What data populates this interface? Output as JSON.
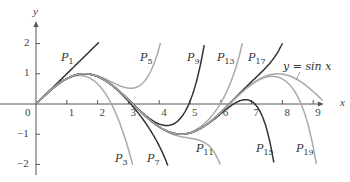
{
  "chart_data": {
    "type": "line",
    "title": "",
    "xlabel": "x",
    "ylabel": "y",
    "xlim": [
      0,
      9.3
    ],
    "ylim": [
      -2.2,
      2.5
    ],
    "x_ticks": [
      "0",
      "1",
      "2",
      "3",
      "4",
      "5",
      "6",
      "7",
      "8",
      "9"
    ],
    "y_ticks": [
      "2",
      "1",
      "-1",
      "-2"
    ],
    "grid": false,
    "series": [
      {
        "name": "y = sin x",
        "color": "#aaaaaa",
        "order": "sin"
      },
      {
        "name": "P1",
        "color": "#333333",
        "order": 1
      },
      {
        "name": "P3",
        "color": "#aaaaaa",
        "order": 3
      },
      {
        "name": "P5",
        "color": "#aaaaaa",
        "order": 5
      },
      {
        "name": "P7",
        "color": "#333333",
        "order": 7
      },
      {
        "name": "P9",
        "color": "#333333",
        "order": 9
      },
      {
        "name": "P11",
        "color": "#aaaaaa",
        "order": 11
      },
      {
        "name": "P13",
        "color": "#aaaaaa",
        "order": 13
      },
      {
        "name": "P15",
        "color": "#333333",
        "order": 15
      },
      {
        "name": "P17",
        "color": "#333333",
        "order": 17
      },
      {
        "name": "P19",
        "color": "#aaaaaa",
        "order": 19
      }
    ],
    "annotations": [
      "P1",
      "P3",
      "P5",
      "P7",
      "P9",
      "P11",
      "P13",
      "P15",
      "P17",
      "P19",
      "y = sin x"
    ]
  },
  "axes": {
    "x_label": "x",
    "y_label": "y",
    "origin_label": "0",
    "x_ticks": [
      "1",
      "2",
      "3",
      "4",
      "5",
      "6",
      "7",
      "8",
      "9"
    ],
    "y_ticks": {
      "p2": "2",
      "p1": "1",
      "m1": "−1",
      "m2": "−2"
    }
  },
  "labels": {
    "P": "P",
    "s1": "1",
    "s3": "3",
    "s5": "5",
    "s7": "7",
    "s9": "9",
    "s11": "11",
    "s13": "13",
    "s15": "15",
    "s17": "17",
    "s19": "19",
    "sin": "y = sin x"
  }
}
